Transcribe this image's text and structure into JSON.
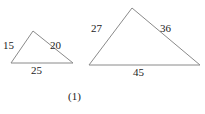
{
  "figure": {
    "caption": "(1)",
    "stroke_color": "#8a8a8a",
    "text_color": "#1c1c1c",
    "background_color": "#ffffff"
  },
  "diagram_data": {
    "type": "geometry-diagram",
    "description": "Two similar triangles with side lengths labeled",
    "shapes": [
      {
        "name": "left-triangle",
        "kind": "triangle",
        "vertices": [
          {
            "name": "bottom-left",
            "x": 11,
            "y": 63
          },
          {
            "name": "apex",
            "x": 33,
            "y": 31
          },
          {
            "name": "bottom-right",
            "x": 73,
            "y": 63
          }
        ],
        "side_labels": [
          {
            "name": "left-side",
            "value": "15"
          },
          {
            "name": "right-side",
            "value": "20"
          },
          {
            "name": "bottom-side",
            "value": "25"
          }
        ]
      },
      {
        "name": "right-triangle",
        "kind": "triangle",
        "vertices": [
          {
            "name": "bottom-left",
            "x": 89,
            "y": 65
          },
          {
            "name": "apex",
            "x": 132,
            "y": 8
          },
          {
            "name": "bottom-right",
            "x": 200,
            "y": 65
          }
        ],
        "side_labels": [
          {
            "name": "left-side",
            "value": "27"
          },
          {
            "name": "right-side",
            "value": "36"
          },
          {
            "name": "bottom-side",
            "value": "45"
          }
        ]
      }
    ]
  },
  "labels": {
    "left_triangle": {
      "side_a": "15",
      "side_b": "20",
      "side_c": "25"
    },
    "right_triangle": {
      "side_a": "27",
      "side_b": "36",
      "side_c": "45"
    }
  }
}
